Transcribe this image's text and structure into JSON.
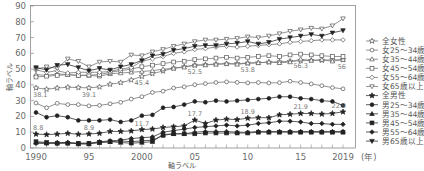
{
  "chart_data": {
    "type": "line",
    "title": "",
    "xlabel": "軸ラベル",
    "ylabel": "軸ラベル",
    "x_unit_label": "(年)",
    "xlim": [
      1990,
      2019
    ],
    "ylim": [
      0,
      90
    ],
    "grid": false,
    "legend_position": "right",
    "x": [
      1990,
      1991,
      1992,
      1993,
      1994,
      1995,
      1996,
      1997,
      1998,
      1999,
      2000,
      2001,
      2002,
      2003,
      2004,
      2005,
      2006,
      2007,
      2008,
      2009,
      2010,
      2011,
      2012,
      2013,
      2014,
      2015,
      2016,
      2017,
      2018,
      2019
    ],
    "x_ticks": [
      1990,
      1995,
      2000,
      2005,
      2010,
      2015,
      2019
    ],
    "x_tick_labels": [
      "1990",
      "95",
      "2000",
      "05",
      "10",
      "15",
      "2019"
    ],
    "y_ticks": [
      0,
      10,
      20,
      30,
      40,
      50,
      60,
      70,
      80,
      90
    ],
    "y_tick_labels": [
      "0",
      "10",
      "20",
      "30",
      "40",
      "50",
      "60",
      "70",
      "80",
      "90"
    ],
    "series": [
      {
        "name": "全女性",
        "marker": "star-open",
        "values": [
          38.1,
          37.2,
          38.0,
          38.5,
          38.3,
          38.1,
          38.7,
          40.4,
          41.4,
          43.1,
          45.4,
          47.1,
          48.8,
          50.6,
          51.5,
          52.5,
          52.8,
          53.2,
          53.4,
          53.5,
          53.8,
          54.0,
          54.4,
          54.6,
          55.0,
          55.3,
          55.5,
          55.6,
          55.8,
          56.0
        ]
      },
      {
        "name": "女25～34歳",
        "marker": "circle-open",
        "values": [
          28.5,
          25.5,
          28.3,
          27.5,
          27.5,
          26.7,
          27.0,
          28.0,
          29.0,
          31.0,
          32.5,
          35.2,
          36.0,
          38.0,
          38.8,
          40.1,
          40.8,
          41.5,
          41.9,
          41.6,
          41.3,
          41.5,
          41.2,
          41.4,
          42.3,
          41.5,
          40.6,
          39.5,
          38.3,
          37.5
        ]
      },
      {
        "name": "女35～44歳",
        "marker": "triangle-up-open",
        "values": [
          46.5,
          46.0,
          47.0,
          46.5,
          46.0,
          46.0,
          45.5,
          47.0,
          47.5,
          48.0,
          48.5,
          49.0,
          50.0,
          50.5,
          51.2,
          52.5,
          52.6,
          53.0,
          53.5,
          53.0,
          53.8,
          54.0,
          54.5,
          54.0,
          54.5,
          56.3,
          55.5,
          56.0,
          55.0,
          56.0
        ]
      },
      {
        "name": "女45～54歳",
        "marker": "square-open",
        "values": [
          45.0,
          45.5,
          46.0,
          46.5,
          46.0,
          46.2,
          46.5,
          48.0,
          49.0,
          50.0,
          51.5,
          52.5,
          53.5,
          54.5,
          55.0,
          56.0,
          56.5,
          57.0,
          57.5,
          57.0,
          57.5,
          58.0,
          58.5,
          58.0,
          59.0,
          59.5,
          59.0,
          58.5,
          58.0,
          58.0
        ]
      },
      {
        "name": "女55～64歳",
        "marker": "diamond-open",
        "values": [
          49.5,
          48.0,
          49.0,
          47.5,
          48.0,
          48.0,
          48.0,
          48.5,
          50.0,
          51.0,
          55.0,
          56.5,
          58.0,
          60.0,
          61.0,
          62.5,
          63.0,
          64.0,
          64.5,
          64.0,
          64.5,
          65.0,
          65.5,
          66.0,
          67.0,
          67.5,
          68.0,
          68.5,
          68.5,
          68.5
        ]
      },
      {
        "name": "女65歳以上",
        "marker": "triangle-down-open",
        "values": [
          50.0,
          51.5,
          50.5,
          56.5,
          55.0,
          51.5,
          54.5,
          55.0,
          54.5,
          59.0,
          58.5,
          61.0,
          62.5,
          64.5,
          66.0,
          67.5,
          68.5,
          68.5,
          69.0,
          69.5,
          70.5,
          70.0,
          71.0,
          72.5,
          74.0,
          75.0,
          76.0,
          75.5,
          77.5,
          82.0
        ]
      },
      {
        "name": "全男性",
        "marker": "star-filled",
        "values": [
          8.8,
          8.5,
          8.8,
          9.3,
          8.7,
          8.9,
          9.3,
          10.5,
          10.5,
          10.8,
          11.7,
          12.0,
          13.0,
          13.5,
          14.0,
          17.7,
          15.5,
          17.7,
          18.3,
          18.0,
          18.9,
          19.2,
          19.2,
          21.0,
          21.4,
          21.9,
          21.9,
          21.5,
          21.9,
          22.9
        ]
      },
      {
        "name": "男25～34歳",
        "marker": "dot-filled",
        "values": [
          22.5,
          19.5,
          20.5,
          19.5,
          17.5,
          17.5,
          17.5,
          18.0,
          16.5,
          17.5,
          20.5,
          21.0,
          25.5,
          26.0,
          27.5,
          29.5,
          29.0,
          30.0,
          29.5,
          30.0,
          30.5,
          31.0,
          31.5,
          32.5,
          32.5,
          31.5,
          31.0,
          30.0,
          29.5,
          27.0
        ]
      },
      {
        "name": "男35～44歳",
        "marker": "triangle-up-filled",
        "values": [
          3.5,
          3.0,
          3.5,
          3.5,
          2.5,
          2.5,
          3.5,
          4.0,
          3.5,
          3.0,
          3.5,
          4.0,
          8.5,
          9.0,
          9.0,
          10.0,
          10.5,
          10.5,
          10.5,
          10.0,
          10.0,
          10.5,
          10.5,
          10.5,
          10.5,
          10.5,
          10.5,
          10.5,
          10.5,
          10.5
        ]
      },
      {
        "name": "男45～54歳",
        "marker": "square-filled",
        "values": [
          4.0,
          3.5,
          3.0,
          3.0,
          3.0,
          3.0,
          3.5,
          4.0,
          4.5,
          4.0,
          4.5,
          5.0,
          8.0,
          9.0,
          9.0,
          9.0,
          9.5,
          9.5,
          9.5,
          9.5,
          9.5,
          10.0,
          10.0,
          10.0,
          10.0,
          10.0,
          10.0,
          10.0,
          10.0,
          10.0
        ]
      },
      {
        "name": "男55～64歳",
        "marker": "diamond-filled",
        "values": [
          3.0,
          3.0,
          3.0,
          3.5,
          3.0,
          3.0,
          4.0,
          4.5,
          5.0,
          6.0,
          6.5,
          7.0,
          10.0,
          11.0,
          12.0,
          13.0,
          13.5,
          14.0,
          14.5,
          14.0,
          14.5,
          15.5,
          16.0,
          17.0,
          17.0,
          16.5,
          15.5,
          15.5,
          15.0,
          15.0
        ]
      },
      {
        "name": "男65歳以上",
        "marker": "triangle-down-filled",
        "values": [
          51.0,
          49.5,
          52.5,
          53.0,
          51.0,
          49.0,
          50.5,
          49.5,
          51.5,
          53.0,
          55.5,
          58.5,
          59.5,
          62.0,
          63.0,
          64.5,
          65.0,
          65.0,
          66.0,
          66.5,
          67.5,
          66.0,
          67.0,
          69.0,
          70.0,
          71.0,
          72.0,
          71.0,
          73.0,
          74.5
        ]
      }
    ],
    "annotations": [
      {
        "text": "38.1",
        "x": 1990,
        "y": 38.1,
        "series": "全女性"
      },
      {
        "text": "39.1",
        "x": 1995,
        "y": 38.1,
        "series": "全女性"
      },
      {
        "text": "45.4",
        "x": 2000,
        "y": 45.4,
        "series": "全女性"
      },
      {
        "text": "52.5",
        "x": 2005,
        "y": 52.5,
        "series": "全女性"
      },
      {
        "text": "53.8",
        "x": 2010,
        "y": 53.8,
        "series": "全女性"
      },
      {
        "text": "56.3",
        "x": 2015,
        "y": 56.3,
        "series": "全女性"
      },
      {
        "text": "56",
        "x": 2019,
        "y": 56.0,
        "series": "全女性"
      },
      {
        "text": "8.8",
        "x": 1990,
        "y": 8.8,
        "series": "全男性"
      },
      {
        "text": "8.9",
        "x": 1995,
        "y": 8.9,
        "series": "全男性"
      },
      {
        "text": "11.7",
        "x": 2000,
        "y": 11.7,
        "series": "全男性"
      },
      {
        "text": "17.7",
        "x": 2005,
        "y": 17.7,
        "series": "全男性"
      },
      {
        "text": "18.9",
        "x": 2010,
        "y": 18.9,
        "series": "全男性"
      },
      {
        "text": "21.9",
        "x": 2015,
        "y": 21.9,
        "series": "全男性"
      },
      {
        "text": "22.9",
        "x": 2019,
        "y": 22.9,
        "series": "全男性"
      }
    ]
  }
}
